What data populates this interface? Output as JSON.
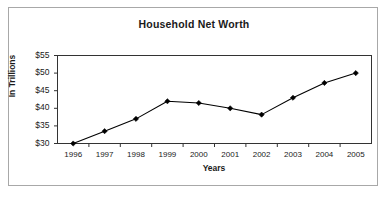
{
  "figure": {
    "title": "Household Net Worth",
    "border_color": "#a8a8a8",
    "background": "#ffffff"
  },
  "axes": {
    "y_title": "In Trillions",
    "x_title": "Years"
  },
  "chart_data": {
    "type": "line",
    "title": "Household Net Worth",
    "xlabel": "Years",
    "ylabel": "In Trillions",
    "categories": [
      "1996",
      "1997",
      "1998",
      "1999",
      "2000",
      "2001",
      "2002",
      "2003",
      "2004",
      "2005"
    ],
    "values": [
      30.0,
      33.5,
      37.0,
      42.0,
      41.5,
      40.0,
      38.2,
      43.0,
      47.2,
      50.0
    ],
    "y_tick_labels": [
      "$30",
      "$35",
      "$40",
      "$45",
      "$50",
      "$55"
    ],
    "y_ticks": [
      30,
      35,
      40,
      45,
      50,
      55
    ],
    "ylim": [
      30,
      55
    ],
    "grid": false,
    "legend": false,
    "series_color": "#000000",
    "marker": "diamond",
    "marker_color": "#000000"
  }
}
